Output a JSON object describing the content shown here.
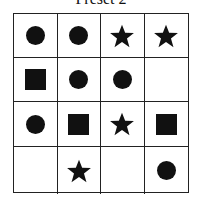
{
  "title": "Preset 2",
  "grid": {
    "rows": 4,
    "cols": 4,
    "cells": [
      [
        "circle",
        "circle",
        "star",
        "star"
      ],
      [
        "square",
        "circle",
        "circle",
        "empty"
      ],
      [
        "circle",
        "square",
        "star",
        "square"
      ],
      [
        "empty",
        "star",
        "empty",
        "circle"
      ]
    ]
  },
  "colors": {
    "shape": "#111111",
    "line": "#222222",
    "background": "#ffffff"
  }
}
